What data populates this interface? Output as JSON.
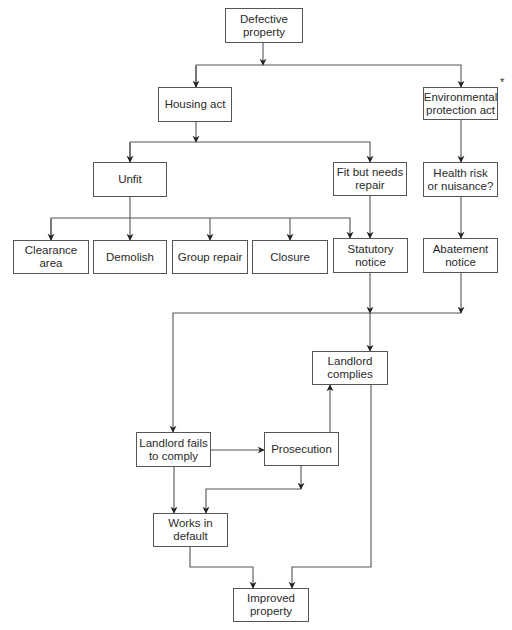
{
  "diagram": {
    "type": "flowchart",
    "nodes": {
      "defective": "Defective\nproperty",
      "housing": "Housing act",
      "environmental": "Environmental\nprotection act",
      "unfit": "Unfit",
      "fit": "Fit but needs\nrepair",
      "health": "Health risk\nor nuisance?",
      "clearance": "Clearance\narea",
      "demolish": "Demolish",
      "group": "Group repair",
      "closure": "Closure",
      "statutory": "Statutory\nnotice",
      "abatement": "Abatement\nnotice",
      "complies": "Landlord\ncomplies",
      "fails": "Landlord fails\nto comply",
      "prosecution": "Prosecution",
      "works": "Works in\ndefault",
      "improved": "Improved\nproperty"
    },
    "footnote_marker": "*",
    "edges": [
      [
        "Defective property",
        "Housing act"
      ],
      [
        "Defective property",
        "Environmental protection act"
      ],
      [
        "Housing act",
        "Unfit"
      ],
      [
        "Housing act",
        "Fit but needs repair"
      ],
      [
        "Environmental protection act",
        "Health risk or nuisance?"
      ],
      [
        "Unfit",
        "Clearance area"
      ],
      [
        "Unfit",
        "Demolish"
      ],
      [
        "Unfit",
        "Group repair"
      ],
      [
        "Unfit",
        "Closure"
      ],
      [
        "Unfit",
        "Statutory notice"
      ],
      [
        "Fit but needs repair",
        "Statutory notice"
      ],
      [
        "Health risk or nuisance?",
        "Abatement notice"
      ],
      [
        "Statutory notice",
        "Landlord complies"
      ],
      [
        "Abatement notice",
        "Landlord complies"
      ],
      [
        "Statutory notice",
        "Landlord fails to comply"
      ],
      [
        "Abatement notice",
        "Landlord fails to comply"
      ],
      [
        "Landlord fails to comply",
        "Prosecution"
      ],
      [
        "Prosecution",
        "Landlord complies"
      ],
      [
        "Prosecution",
        "Works in default"
      ],
      [
        "Landlord fails to comply",
        "Works in default"
      ],
      [
        "Works in default",
        "Improved property"
      ],
      [
        "Landlord complies",
        "Improved property"
      ]
    ]
  }
}
